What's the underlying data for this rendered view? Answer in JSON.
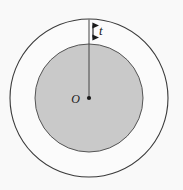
{
  "figure": {
    "labels": {
      "thickness": "t",
      "center": "O"
    },
    "colors": {
      "background": "#f9f9f9",
      "inner_fill": "#c9c9c9",
      "stroke": "#3a3a3a",
      "annulus_fill": "#fbfbfb"
    },
    "geometry": {
      "center_x": 89,
      "center_y": 98,
      "outer_radius": 79,
      "inner_radius": 54,
      "thickness": 25,
      "stroke_width": 1
    },
    "elements": {
      "outer_circle": "outer-circle",
      "inner_circle": "inner-shaded-circle",
      "radius_line": "radius-line",
      "center_dot": "center-point",
      "thickness_arrow": "thickness-double-arrow"
    }
  }
}
